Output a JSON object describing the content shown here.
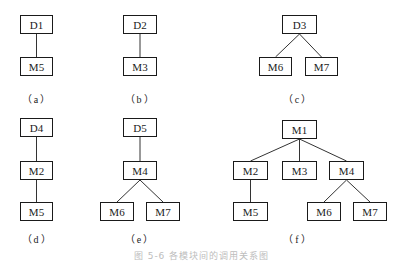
{
  "diagram": {
    "type": "module-call-hierarchy",
    "panels": [
      {
        "id": "a",
        "label": "（a）",
        "nodes": [
          {
            "id": "a-D1",
            "label": "D1",
            "x": 20,
            "y": 15,
            "w": 33,
            "h": 19
          },
          {
            "id": "a-M5",
            "label": "M5",
            "x": 20,
            "y": 57,
            "w": 33,
            "h": 19
          }
        ],
        "edges": [
          [
            "a-D1",
            "a-M5"
          ]
        ]
      },
      {
        "id": "b",
        "label": "（b）",
        "nodes": [
          {
            "id": "b-D2",
            "label": "D2",
            "x": 123,
            "y": 15,
            "w": 34,
            "h": 19
          },
          {
            "id": "b-M3",
            "label": "M3",
            "x": 123,
            "y": 57,
            "w": 34,
            "h": 19
          }
        ],
        "edges": [
          [
            "b-D2",
            "b-M3"
          ]
        ]
      },
      {
        "id": "c",
        "label": "（c）",
        "nodes": [
          {
            "id": "c-D3",
            "label": "D3",
            "x": 282,
            "y": 15,
            "w": 35,
            "h": 19
          },
          {
            "id": "c-M6",
            "label": "M6",
            "x": 259,
            "y": 57,
            "w": 33,
            "h": 19
          },
          {
            "id": "c-M7",
            "label": "M7",
            "x": 305,
            "y": 57,
            "w": 33,
            "h": 19
          }
        ],
        "edges": [
          [
            "c-D3",
            "c-M6"
          ],
          [
            "c-D3",
            "c-M7"
          ]
        ]
      },
      {
        "id": "d",
        "label": "（d）",
        "nodes": [
          {
            "id": "d-D4",
            "label": "D4",
            "x": 20,
            "y": 118,
            "w": 33,
            "h": 19
          },
          {
            "id": "d-M2",
            "label": "M2",
            "x": 20,
            "y": 161,
            "w": 33,
            "h": 19
          },
          {
            "id": "d-M5",
            "label": "M5",
            "x": 20,
            "y": 202,
            "w": 33,
            "h": 19
          }
        ],
        "edges": [
          [
            "d-D4",
            "d-M2"
          ],
          [
            "d-M2",
            "d-M5"
          ]
        ]
      },
      {
        "id": "e",
        "label": "（e）",
        "nodes": [
          {
            "id": "e-D5",
            "label": "D5",
            "x": 123,
            "y": 118,
            "w": 34,
            "h": 19
          },
          {
            "id": "e-M4",
            "label": "M4",
            "x": 123,
            "y": 161,
            "w": 34,
            "h": 19
          },
          {
            "id": "e-M6",
            "label": "M6",
            "x": 100,
            "y": 202,
            "w": 34,
            "h": 19
          },
          {
            "id": "e-M7",
            "label": "M7",
            "x": 146,
            "y": 202,
            "w": 34,
            "h": 19
          }
        ],
        "edges": [
          [
            "e-D5",
            "e-M4"
          ],
          [
            "e-M4",
            "e-M6"
          ],
          [
            "e-M4",
            "e-M7"
          ]
        ]
      },
      {
        "id": "f",
        "label": "（f）",
        "nodes": [
          {
            "id": "f-M1",
            "label": "M1",
            "x": 282,
            "y": 120,
            "w": 35,
            "h": 19
          },
          {
            "id": "f-M2",
            "label": "M2",
            "x": 233,
            "y": 161,
            "w": 35,
            "h": 19
          },
          {
            "id": "f-M3",
            "label": "M3",
            "x": 282,
            "y": 161,
            "w": 35,
            "h": 19
          },
          {
            "id": "f-M4",
            "label": "M4",
            "x": 329,
            "y": 161,
            "w": 35,
            "h": 19
          },
          {
            "id": "f-M5",
            "label": "M5",
            "x": 233,
            "y": 202,
            "w": 35,
            "h": 19
          },
          {
            "id": "f-M6",
            "label": "M6",
            "x": 307,
            "y": 202,
            "w": 34,
            "h": 19
          },
          {
            "id": "f-M7",
            "label": "M7",
            "x": 353,
            "y": 202,
            "w": 34,
            "h": 19
          }
        ],
        "edges": [
          [
            "f-M1",
            "f-M2"
          ],
          [
            "f-M1",
            "f-M3"
          ],
          [
            "f-M1",
            "f-M4"
          ],
          [
            "f-M2",
            "f-M5"
          ],
          [
            "f-M4",
            "f-M6"
          ],
          [
            "f-M4",
            "f-M7"
          ]
        ]
      }
    ],
    "sublabels": [
      {
        "text": "（a）",
        "x": 37,
        "y": 91
      },
      {
        "text": "（b）",
        "x": 140,
        "y": 91
      },
      {
        "text": "（c）",
        "x": 298,
        "y": 91
      },
      {
        "text": "（d）",
        "x": 37,
        "y": 231
      },
      {
        "text": "（e）",
        "x": 140,
        "y": 231
      },
      {
        "text": "（f）",
        "x": 298,
        "y": 231
      }
    ],
    "caption": "图 5-6  各模块间的调用关系图"
  },
  "colors": {
    "stroke": "#1a1a1a",
    "edge": "#333333",
    "background": "#ffffff",
    "caption": "#bdbdbd"
  }
}
